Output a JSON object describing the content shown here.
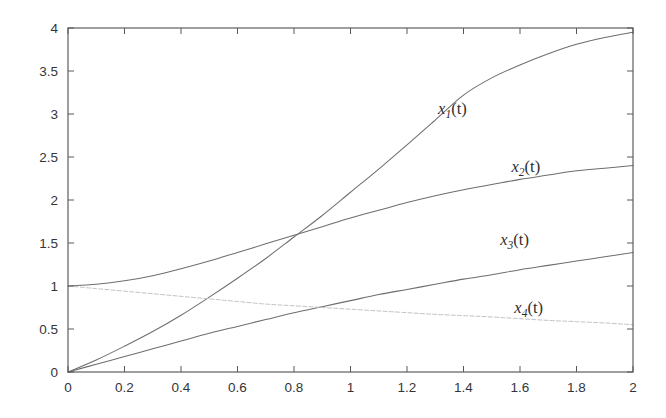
{
  "figure": {
    "background_color": "#ffffff",
    "axis_color": "#58585a",
    "curve_color": "#6e6e72",
    "faint_curve_color": "#c2c2c6"
  },
  "chart_data": {
    "type": "line",
    "title": "",
    "xlabel": "",
    "ylabel": "",
    "xlim": [
      0,
      2
    ],
    "ylim": [
      0,
      4
    ],
    "grid": false,
    "legend_position": "inline-annotations",
    "xticks": [
      0,
      0.2,
      0.4,
      0.6,
      0.8,
      1,
      1.2,
      1.4,
      1.6,
      1.8,
      2
    ],
    "xticklabels": [
      "0",
      "0.2",
      "0.4",
      "0.6",
      "0.8",
      "1",
      "1.2",
      "1.4",
      "1.6",
      "1.8",
      "2"
    ],
    "yticks": [
      0,
      0.5,
      1,
      1.5,
      2,
      2.5,
      3,
      3.5,
      4
    ],
    "yticklabels": [
      "0",
      "0.5",
      "1",
      "1.5",
      "2",
      "2.5",
      "3",
      "3.5",
      "4"
    ],
    "x": [
      0,
      0.1,
      0.2,
      0.3,
      0.4,
      0.5,
      0.6,
      0.7,
      0.8,
      0.9,
      1.0,
      1.1,
      1.2,
      1.3,
      1.4,
      1.5,
      1.6,
      1.7,
      1.8,
      1.9,
      2.0
    ],
    "series": [
      {
        "name": "x1(t)",
        "base": "x",
        "subscript": "1",
        "arg": "(t)",
        "style": "solid",
        "color": "#6e6e72",
        "values": [
          0.0,
          0.14,
          0.3,
          0.47,
          0.66,
          0.87,
          1.09,
          1.32,
          1.57,
          1.82,
          2.09,
          2.36,
          2.64,
          2.93,
          3.22,
          3.42,
          3.57,
          3.7,
          3.81,
          3.89,
          3.95
        ],
        "label_x": 1.31,
        "label_y": 3.0
      },
      {
        "name": "x2(t)",
        "base": "x",
        "subscript": "2",
        "arg": "(t)",
        "style": "solid",
        "color": "#6e6e72",
        "values": [
          1.0,
          1.02,
          1.06,
          1.12,
          1.2,
          1.29,
          1.39,
          1.49,
          1.59,
          1.69,
          1.79,
          1.88,
          1.97,
          2.05,
          2.12,
          2.18,
          2.24,
          2.29,
          2.34,
          2.37,
          2.4
        ],
        "label_x": 1.57,
        "label_y": 2.32
      },
      {
        "name": "x3(t)",
        "base": "x",
        "subscript": "3",
        "arg": "(t)",
        "style": "solid",
        "color": "#6e6e72",
        "values": [
          0.0,
          0.09,
          0.18,
          0.27,
          0.36,
          0.45,
          0.53,
          0.61,
          0.69,
          0.76,
          0.83,
          0.9,
          0.96,
          1.02,
          1.08,
          1.13,
          1.19,
          1.24,
          1.29,
          1.34,
          1.39
        ],
        "label_x": 1.53,
        "label_y": 1.48
      },
      {
        "name": "x4(t)",
        "base": "x",
        "subscript": "4",
        "arg": "(t)",
        "style": "dotted",
        "color": "#c2c2c6",
        "values": [
          1.0,
          0.97,
          0.94,
          0.91,
          0.88,
          0.85,
          0.82,
          0.79,
          0.77,
          0.75,
          0.73,
          0.71,
          0.69,
          0.67,
          0.655,
          0.64,
          0.62,
          0.6,
          0.585,
          0.57,
          0.55
        ],
        "label_x": 1.58,
        "label_y": 0.69
      }
    ]
  }
}
